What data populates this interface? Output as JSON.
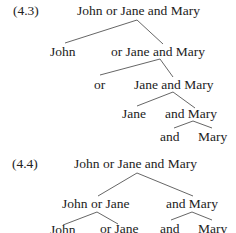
{
  "diagrams": [
    {
      "label": "(4.3)",
      "nodes": {
        "root": "John or Jane and Mary",
        "l1_left": "John",
        "l1_right": "or Jane and Mary",
        "l2_left": "or",
        "l2_right": "Jane and Mary",
        "l3_left": "Jane",
        "l3_right": "and Mary",
        "l4_left": "and",
        "l4_right": "Mary"
      }
    },
    {
      "label": "(4.4)",
      "nodes": {
        "root": "John or Jane and Mary",
        "l1_left": "John or Jane",
        "l1_right": "and Mary",
        "l2_ll": "John",
        "l2_lr": "or Jane",
        "l2_rl": "and",
        "l2_rr": "Mary"
      }
    }
  ],
  "colors": {
    "text": "#222222",
    "lines": "#555555",
    "background": "#ffffff"
  }
}
